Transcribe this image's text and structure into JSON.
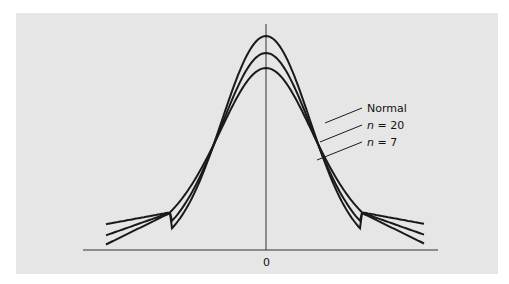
{
  "chart_data": {
    "type": "line",
    "title": "",
    "xlabel": "",
    "ylabel": "",
    "x_ticks": [
      "0"
    ],
    "series": [
      {
        "name": "Normal",
        "label_parts": [
          "Normal"
        ],
        "distribution": "normal",
        "df": null,
        "peak_y_px": 36
      },
      {
        "name": "n = 20",
        "label_parts": [
          "n",
          " = 20"
        ],
        "distribution": "t",
        "df": 19,
        "peak_y_px": 53
      },
      {
        "name": "n = 7",
        "label_parts": [
          "n",
          " = 7"
        ],
        "distribution": "t",
        "df": 6,
        "peak_y_px": 68
      }
    ],
    "annotations": [
      "Normal",
      "n = 20",
      "n = 7"
    ],
    "grid": false,
    "legend": "callout labels at right of curves"
  },
  "axis": {
    "zero_label": "0"
  },
  "colors": {
    "panel_bg": "#e6e6e6",
    "line": "#1a1a1a",
    "axis": "#333333"
  }
}
